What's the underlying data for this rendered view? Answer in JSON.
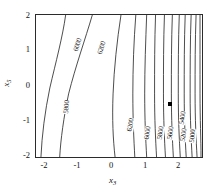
{
  "chart_data": {
    "type": "contour",
    "title": "",
    "xlabel": "x3",
    "ylabel": "x5",
    "xlabel_display": "x",
    "xlabel_sub": "3",
    "ylabel_display": "x",
    "ylabel_sub": "5",
    "xlim": [
      -2.5,
      2.5
    ],
    "ylim": [
      -2.5,
      2.5
    ],
    "xticks": [
      "-2",
      "-1",
      "0",
      "1",
      "2"
    ],
    "xtick_values": [
      -2,
      -1,
      0,
      1,
      2
    ],
    "yticks": [
      "2",
      "1",
      "0",
      "-1",
      "-2"
    ],
    "ytick_values": [
      2,
      1,
      0,
      -1,
      -2
    ],
    "grid": false,
    "legend": "none",
    "levels": [
      4200,
      4400,
      4600,
      4800,
      5000,
      5200,
      5400,
      5600,
      5800,
      6000,
      6200
    ],
    "level_labels": [
      "4200",
      "4400",
      "4600",
      "4800",
      "5000",
      "5200",
      "5400",
      "5600",
      "5800",
      "6000",
      "6200"
    ],
    "annotations": [
      {
        "name": "data-point-marker",
        "x": 1.55,
        "y": -0.65,
        "shape": "filled-square"
      }
    ],
    "contour_labels": [
      {
        "text": "6000",
        "x": 43,
        "y": 30,
        "rot": -72
      },
      {
        "text": "6200",
        "x": 67,
        "y": 33,
        "rot": -72
      },
      {
        "text": "5800",
        "x": 31,
        "y": 93,
        "rot": -85
      },
      {
        "text": "6200",
        "x": 96,
        "y": 112,
        "rot": -80
      },
      {
        "text": "6000",
        "x": 113,
        "y": 120,
        "rot": -82
      },
      {
        "text": "5800",
        "x": 126,
        "y": 120,
        "rot": -82
      },
      {
        "text": "5600",
        "x": 137,
        "y": 120,
        "rot": -82
      },
      {
        "text": "5400",
        "x": 149,
        "y": 104,
        "rot": -82
      },
      {
        "text": "5200",
        "x": 150,
        "y": 122,
        "rot": -82
      },
      {
        "text": "5000",
        "x": 159,
        "y": 123,
        "rot": -84
      },
      {
        "text": "4800",
        "x": 172,
        "y": 104,
        "rot": -84
      },
      {
        "text": "4600",
        "x": 172,
        "y": 122,
        "rot": -84
      },
      {
        "text": "4400",
        "x": 180,
        "y": 125,
        "rot": -84
      },
      {
        "text": "4200",
        "x": 190,
        "y": 107,
        "rot": -84
      }
    ],
    "curves": [
      {
        "level": 6000,
        "path": "M 30 0 C 27 22, 20 48, 14 74 C 9 98, 6 122, 5 144"
      },
      {
        "level": 6200,
        "path": "M 57 0 C 50 24, 40 52, 33 80 C 28 104, 25 126, 24 144"
      },
      {
        "level": 6200,
        "path": "M 86 0 C 82 26, 79 54, 78 80 C 77 106, 78 126, 80 144"
      },
      {
        "level": 6000,
        "path": "M 101 0 C 99 26, 98 54, 98 80 C 98 106, 99 126, 100 144"
      },
      {
        "level": 5800,
        "path": "M 112 0 C 111 26, 110 54, 110 80 C 110 106, 111 126, 112 144"
      },
      {
        "level": 5600,
        "path": "M 121 0 C 120 26, 120 54, 120 80 C 120 106, 121 126, 122 144"
      },
      {
        "level": 5400,
        "path": "M 130 0 C 129 26, 129 54, 129 80 C 129 106, 130 126, 131 144"
      },
      {
        "level": 5200,
        "path": "M 138 0 C 137 26, 137 54, 137 80 C 137 106, 138 126, 139 144"
      },
      {
        "level": 5000,
        "path": "M 145 0 C 144 26, 144 54, 144 80 C 144 106, 145 126, 146 144"
      },
      {
        "level": 4800,
        "path": "M 151 0 C 150 26, 150 54, 150 80 C 150 106, 151 126, 152 144"
      },
      {
        "level": 4600,
        "path": "M 157 0 C 156 26, 156 54, 156 80 C 156 106, 157 126, 158 144"
      },
      {
        "level": 4400,
        "path": "M 162 0 C 161 26, 161 54, 161 80 C 161 106, 162 126, 163 144"
      },
      {
        "level": 4200,
        "path": "M 166 0 C 166 26, 166 54, 166 80 C 166 106, 167 126, 167 144"
      }
    ]
  }
}
